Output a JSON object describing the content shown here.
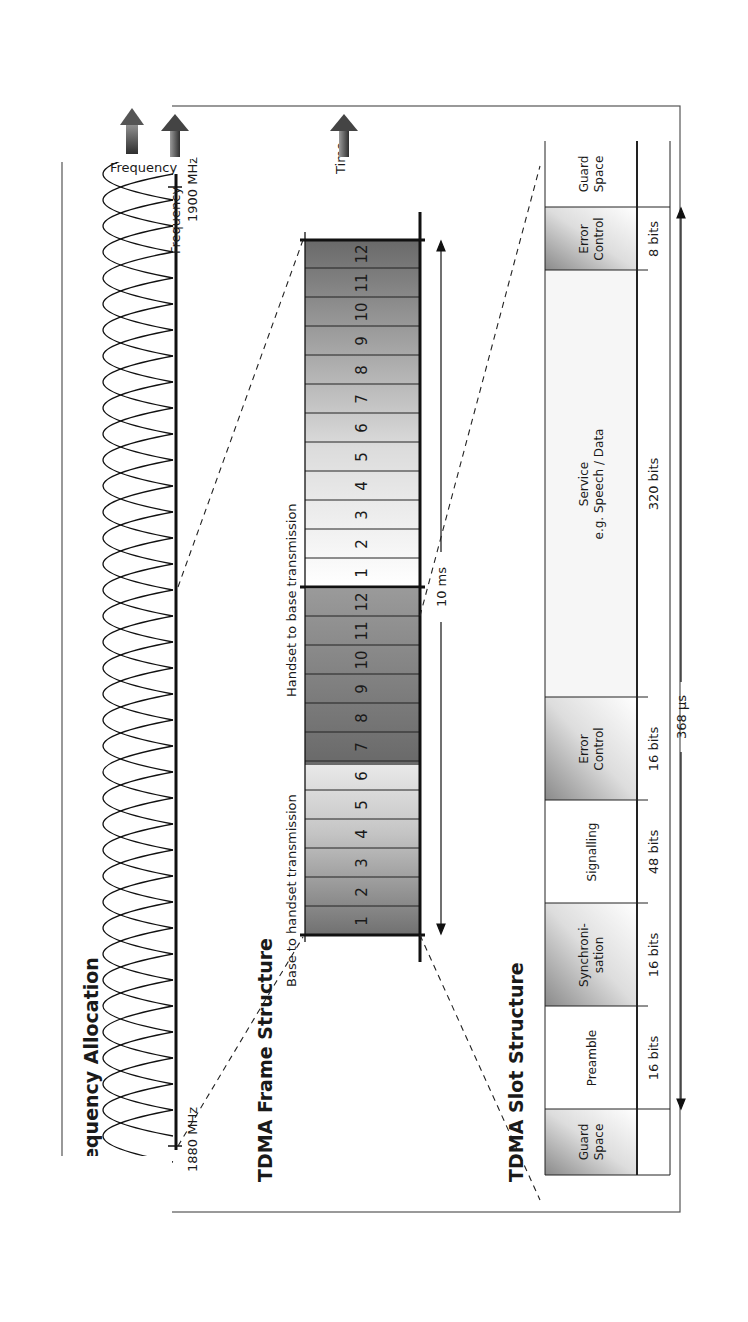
{
  "orientation": "rotated -90deg (text reads bottom-to-top)",
  "frequency_allocation": {
    "title": "Frequency Allocation",
    "start_label": "1880 MHz",
    "end_label": "1900 MHz",
    "axis_label": "Frequency",
    "carrier_count": 10
  },
  "frame_structure": {
    "title": "TDMA Frame Structure",
    "axis_label": "Time",
    "downlink_label": "Base to handset transmission",
    "uplink_label": "Handset to base transmission",
    "downlink_slots": [
      "1",
      "2",
      "3",
      "4",
      "5",
      "6",
      "7",
      "8",
      "9",
      "10",
      "11",
      "12"
    ],
    "uplink_slots": [
      "1",
      "2",
      "3",
      "4",
      "5",
      "6",
      "7",
      "8",
      "9",
      "10",
      "11",
      "12"
    ],
    "duration_label": "10 ms"
  },
  "slot_structure": {
    "title": "TDMA Slot Structure",
    "fields": [
      {
        "name": "Guard Space",
        "line1": "Guard",
        "line2": "Space",
        "bits": ""
      },
      {
        "name": "Preamble",
        "line1": "Preamble",
        "line2": "",
        "bits": "16 bits"
      },
      {
        "name": "Synchronisation",
        "line1": "Synchroni-",
        "line2": "sation",
        "bits": "16 bits"
      },
      {
        "name": "Signalling",
        "line1": "Signalling",
        "line2": "",
        "bits": "48 bits"
      },
      {
        "name": "Error Control",
        "line1": "Error",
        "line2": "Control",
        "bits": "16 bits"
      },
      {
        "name": "Service",
        "line1": "Service",
        "line2": "e.g. Speech / Data",
        "bits": "320 bits"
      },
      {
        "name": "Error Control",
        "line1": "Error",
        "line2": "Control",
        "bits": "8 bits"
      },
      {
        "name": "Guard Space",
        "line1": "Guard",
        "line2": "Space",
        "bits": ""
      }
    ],
    "duration_label": "368 µs"
  }
}
